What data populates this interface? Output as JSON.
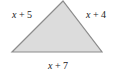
{
  "diagram": {
    "type": "triangle",
    "fill_color": "#dcdcdc",
    "stroke_color": "#8c8c8c",
    "vertices": {
      "apex": [
        63,
        1
      ],
      "bottom_left": [
        12,
        52
      ],
      "bottom_right": [
        102,
        52
      ]
    },
    "sides": {
      "left": {
        "variable": "x",
        "operator": "+",
        "constant": "5"
      },
      "right": {
        "variable": "x",
        "operator": "+",
        "constant": "4"
      },
      "bottom": {
        "variable": "x",
        "operator": "+",
        "constant": "7"
      }
    }
  }
}
